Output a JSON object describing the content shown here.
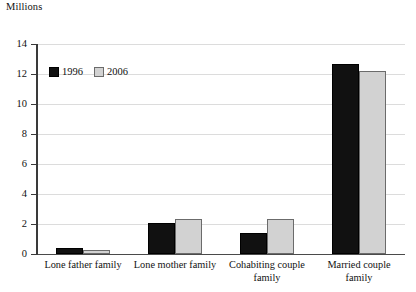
{
  "chart_data": {
    "type": "bar",
    "title": "",
    "subtitle": "",
    "unit_label": "Millions",
    "xlabel": "",
    "ylabel": "Millions",
    "ylim": [
      0,
      14
    ],
    "ytick_step": 2,
    "ytick_labels": [
      "0",
      "2",
      "4",
      "6",
      "8",
      "10",
      "12",
      "14"
    ],
    "ytick_values": [
      0,
      2,
      4,
      6,
      8,
      10,
      12,
      14
    ],
    "grid": true,
    "grid_axis": "y",
    "legend_position": "upper-left-inside",
    "categories": [
      "Lone father family",
      "Lone mother family",
      "Cohabiting couple family",
      "Married couple family"
    ],
    "series": [
      {
        "name": "1996",
        "color": "#111111",
        "values": [
          0.4,
          2.1,
          1.4,
          12.7
        ]
      },
      {
        "name": "2006",
        "color": "#d2d2d2",
        "values": [
          0.3,
          2.35,
          2.35,
          12.2
        ]
      }
    ]
  },
  "legend": {
    "entries": [
      {
        "label": "1996"
      },
      {
        "label": "2006"
      }
    ]
  }
}
